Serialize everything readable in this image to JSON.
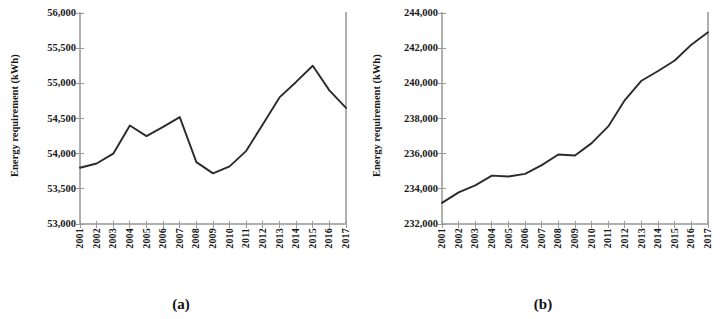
{
  "figure": {
    "caption_a": "(a)",
    "caption_b": "(b)",
    "axis_title": "Energy requirement (kWh)",
    "line_color": "#2b2b2b",
    "axis_color": "#b0b0b0",
    "tick_color": "#9a9a9a",
    "text_color": "#1a1a1a"
  },
  "chart_data": [
    {
      "panel": "a",
      "type": "line",
      "title": "",
      "xlabel": "",
      "ylabel": "Energy requirement (kWh)",
      "categories": [
        "2001",
        "2002",
        "2003",
        "2004",
        "2005",
        "2006",
        "2007",
        "2008",
        "2009",
        "2010",
        "2011",
        "2012",
        "2013",
        "2014",
        "2015",
        "2016",
        "2017"
      ],
      "values": [
        53800,
        53860,
        54000,
        54400,
        54250,
        54380,
        54520,
        53880,
        53720,
        53820,
        54040,
        54420,
        54800,
        55020,
        55250,
        54900,
        54650
      ],
      "ylim": [
        53000,
        56000
      ],
      "yticks": [
        53000,
        53500,
        54000,
        54500,
        55000,
        55500,
        56000
      ],
      "ytick_labels": [
        "53,000",
        "53,500",
        "54,000",
        "54,500",
        "55,000",
        "55,500",
        "56,000"
      ],
      "grid": false,
      "legend": "none"
    },
    {
      "panel": "b",
      "type": "line",
      "title": "",
      "xlabel": "",
      "ylabel": "Energy requirement (kWh)",
      "categories": [
        "2001",
        "2002",
        "2003",
        "2004",
        "2005",
        "2006",
        "2007",
        "2008",
        "2009",
        "2010",
        "2011",
        "2012",
        "2013",
        "2014",
        "2015",
        "2016",
        "2017"
      ],
      "values": [
        233200,
        233800,
        234200,
        234750,
        234700,
        234850,
        235350,
        235950,
        235900,
        236600,
        237550,
        239050,
        240150,
        240700,
        241300,
        242200,
        242900
      ],
      "ylim": [
        232000,
        244000
      ],
      "yticks": [
        232000,
        234000,
        236000,
        238000,
        240000,
        242000,
        244000
      ],
      "ytick_labels": [
        "232,000",
        "234,000",
        "236,000",
        "238,000",
        "240,000",
        "242,000",
        "244,000"
      ],
      "grid": false,
      "legend": "none"
    }
  ]
}
